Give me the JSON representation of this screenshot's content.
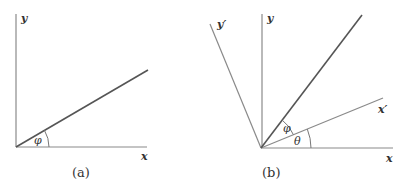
{
  "panels": [
    {
      "id": "a",
      "caption": "(a)",
      "labels": {
        "x_axis": "x",
        "y_axis": "y",
        "angle": "φ"
      }
    },
    {
      "id": "b",
      "caption": "(b)",
      "labels": {
        "x_axis": "x",
        "y_axis": "y",
        "x_prime_axis": "x′",
        "y_prime_axis": "y′",
        "angle_phi": "φ",
        "angle_theta": "θ"
      }
    }
  ],
  "colors": {
    "axis": "#8a8a8a",
    "vector": "#555555",
    "text": "#333333",
    "background": "#ffffff"
  }
}
